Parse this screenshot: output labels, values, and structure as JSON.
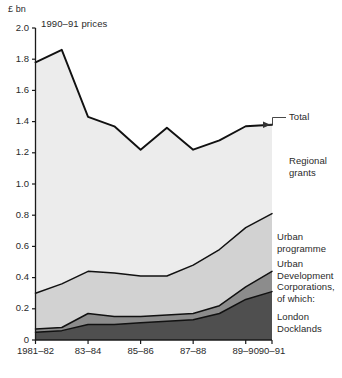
{
  "chart_data": {
    "type": "area",
    "title": "",
    "subtitle": "1990–91 prices",
    "ylabel": "£ bn",
    "xlabel": "",
    "ylim": [
      0,
      2.0
    ],
    "yticks": [
      "0",
      "0.2",
      "0.4",
      "0.6",
      "0.8",
      "1.0",
      "1.2",
      "1.4",
      "1.6",
      "1.8",
      "2.0"
    ],
    "ytick_values": [
      0,
      0.2,
      0.4,
      0.6,
      0.8,
      1.0,
      1.2,
      1.4,
      1.6,
      1.8,
      2.0
    ],
    "categories": [
      "1981–82",
      "82–83",
      "83–84",
      "84–85",
      "85–86",
      "86–87",
      "87–88",
      "88–89",
      "89–90",
      "90–91"
    ],
    "xtick_labels": [
      "1981–82",
      "83–84",
      "85–86",
      "87–88",
      "89–90",
      "90–91"
    ],
    "xtick_indices": [
      0,
      2,
      4,
      6,
      8,
      9
    ],
    "grid": false,
    "legend_position": "right-inline",
    "stacking": "cumulative-from-zero",
    "series": [
      {
        "name": "London Docklands",
        "color": "#4f4f4f",
        "cumulative_values": [
          0.05,
          0.06,
          0.1,
          0.1,
          0.11,
          0.12,
          0.13,
          0.17,
          0.26,
          0.31
        ]
      },
      {
        "name": "Urban Development Corporations, of which:",
        "color": "#8c8c8c",
        "cumulative_values": [
          0.07,
          0.08,
          0.17,
          0.15,
          0.15,
          0.16,
          0.17,
          0.22,
          0.34,
          0.44
        ]
      },
      {
        "name": "Urban programme",
        "color": "#d2d2d2",
        "cumulative_values": [
          0.3,
          0.36,
          0.44,
          0.43,
          0.41,
          0.41,
          0.48,
          0.58,
          0.72,
          0.81
        ]
      },
      {
        "name": "Regional grants",
        "color": "#ececec",
        "cumulative_values": [
          1.78,
          1.86,
          1.43,
          1.37,
          1.22,
          1.36,
          1.22,
          1.28,
          1.37,
          1.38
        ]
      }
    ],
    "total_line": {
      "name": "Total",
      "values": [
        1.78,
        1.86,
        1.43,
        1.37,
        1.22,
        1.36,
        1.22,
        1.28,
        1.37,
        1.38
      ]
    },
    "annotations": [
      {
        "name": "total",
        "text": "Total"
      },
      {
        "name": "regional-grants",
        "text": "Regional\ngrants"
      },
      {
        "name": "urban-programme",
        "text": "Urban\nprogramme"
      },
      {
        "name": "udc",
        "text": "Urban\nDevelopment\nCorporations,\nof which:"
      },
      {
        "name": "london-docklands",
        "text": "London\nDocklands"
      }
    ]
  },
  "colors": {
    "axis": "#1a1a1a",
    "line": "#111111",
    "regional_grants": "#ececec",
    "urban_programme": "#d2d2d2",
    "udc": "#8c8c8c",
    "london_docklands": "#4f4f4f",
    "text": "#2a2a2a"
  }
}
